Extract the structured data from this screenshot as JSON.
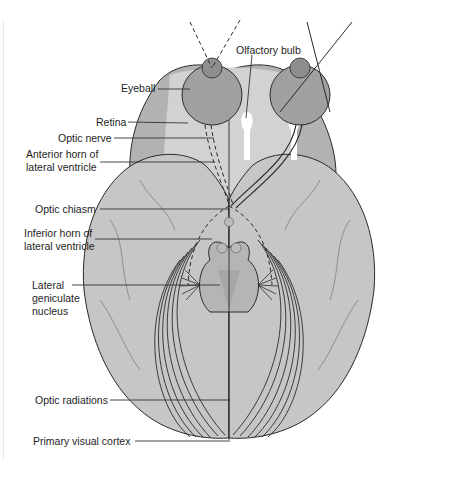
{
  "figure": {
    "colors": {
      "background": "#ffffff",
      "cortex": "#c9c9c9",
      "cortex_light": "#dadada",
      "frontal_dark": "#a9a9a9",
      "eyeball": "#a0a0a0",
      "ventricle": "#ffffff",
      "line": "#2a2a2a",
      "gyri": "#6f6f6f"
    }
  },
  "labels": {
    "eyeball": "Eyeball",
    "olfactory_bulb": "Olfactory bulb",
    "retina": "Retina",
    "optic_nerve": "Optic nerve",
    "anterior_horn_1": "Anterior horn of",
    "anterior_horn_2": "lateral ventricle",
    "optic_chiasm": "Optic chiasm",
    "inferior_horn_1": "Inferior horn of",
    "inferior_horn_2": "lateral ventricle",
    "lgn_1": "Lateral",
    "lgn_2": "geniculate",
    "lgn_3": "nucleus",
    "optic_radiations": "Optic radiations",
    "primary_visual_cortex": "Primary visual cortex"
  }
}
